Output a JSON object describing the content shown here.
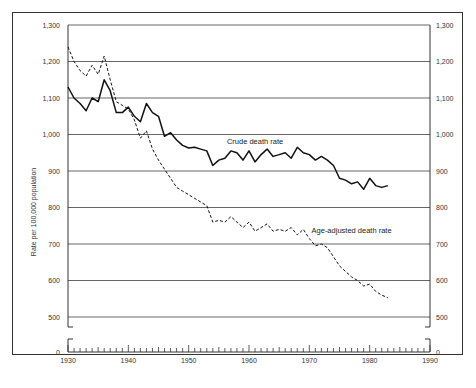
{
  "chart_data": {
    "type": "line",
    "title": "",
    "xlabel": "",
    "ylabel": "Rate per 100,000 population",
    "ylim": [
      500,
      1300
    ],
    "xlim": [
      1930,
      1990
    ],
    "y_axis_break": true,
    "y_ticks": [
      "0",
      "500",
      "600",
      "700",
      "800",
      "900",
      "1,000",
      "1,100",
      "1,200",
      "1,300"
    ],
    "x_ticks": [
      "1930",
      "1940",
      "1950",
      "1960",
      "1970",
      "1980",
      "1990"
    ],
    "grid": true,
    "legend_position": "inline labels",
    "x": [
      1930,
      1931,
      1932,
      1933,
      1934,
      1935,
      1936,
      1937,
      1938,
      1939,
      1940,
      1941,
      1942,
      1943,
      1944,
      1945,
      1946,
      1947,
      1948,
      1949,
      1950,
      1951,
      1952,
      1953,
      1954,
      1955,
      1956,
      1957,
      1958,
      1959,
      1960,
      1961,
      1962,
      1963,
      1964,
      1965,
      1966,
      1967,
      1968,
      1969,
      1970,
      1971,
      1972,
      1973,
      1974,
      1975,
      1976,
      1977,
      1978,
      1979,
      1980,
      1981,
      1982,
      1983
    ],
    "series": [
      {
        "name": "Crude death rate",
        "style": "solid",
        "values": [
          1130,
          1100,
          1085,
          1065,
          1100,
          1090,
          1150,
          1120,
          1060,
          1060,
          1075,
          1050,
          1035,
          1085,
          1060,
          1050,
          995,
          1005,
          985,
          970,
          963,
          965,
          960,
          955,
          915,
          930,
          935,
          955,
          950,
          930,
          955,
          925,
          945,
          960,
          940,
          945,
          950,
          935,
          965,
          950,
          945,
          930,
          940,
          930,
          915,
          880,
          875,
          865,
          870,
          850,
          880,
          860,
          855,
          860
        ]
      },
      {
        "name": "Age-adjusted death rate",
        "style": "dashed",
        "values": [
          1240,
          1200,
          1175,
          1160,
          1190,
          1165,
          1215,
          1150,
          1090,
          1080,
          1070,
          1040,
          990,
          1010,
          960,
          930,
          905,
          880,
          855,
          845,
          835,
          825,
          815,
          805,
          760,
          765,
          760,
          775,
          760,
          745,
          760,
          735,
          745,
          755,
          735,
          740,
          735,
          745,
          725,
          740,
          715,
          695,
          700,
          690,
          665,
          640,
          625,
          610,
          600,
          585,
          590,
          570,
          560,
          553
        ]
      }
    ],
    "annotations": [
      {
        "text": "Crude death rate",
        "year": 1961,
        "value": 975
      },
      {
        "text": "Age-adjusted death rate",
        "year": 1977,
        "value": 730
      }
    ]
  }
}
